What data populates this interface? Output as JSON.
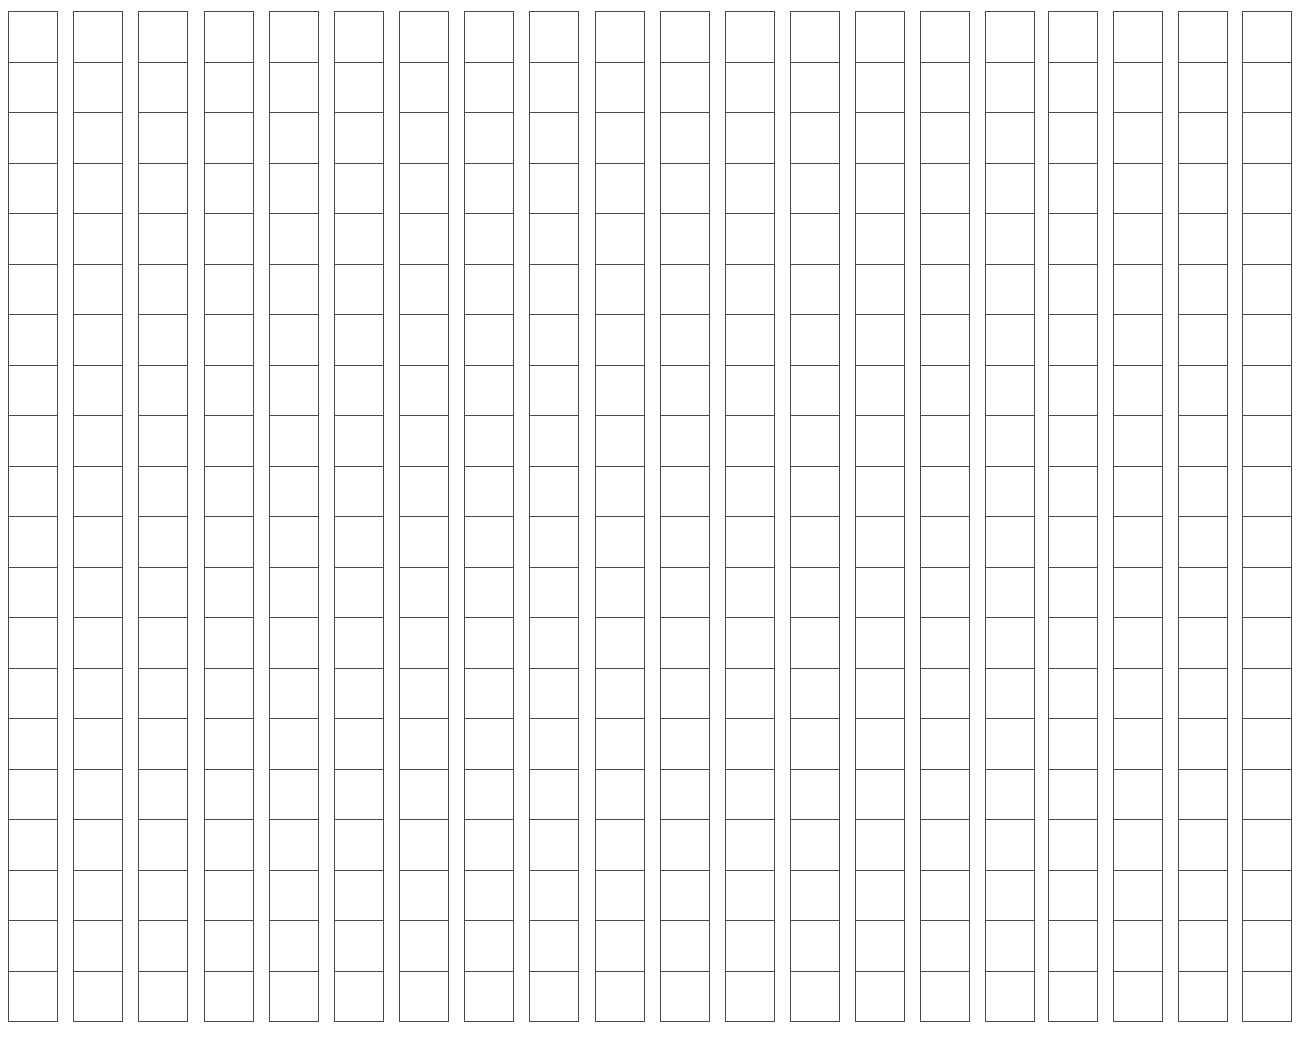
{
  "worksheet": {
    "type": "blank-squared-column-grid",
    "column_count": 20,
    "row_count": 20,
    "line_color": "#4a4a4a",
    "background_color": "#ffffff",
    "column_left_positions": [
      8,
      73,
      138,
      204,
      269,
      334,
      399,
      464,
      529,
      595,
      660,
      725,
      790,
      855,
      920,
      985,
      1048,
      1113,
      1178,
      1242
    ],
    "cells_text": []
  }
}
